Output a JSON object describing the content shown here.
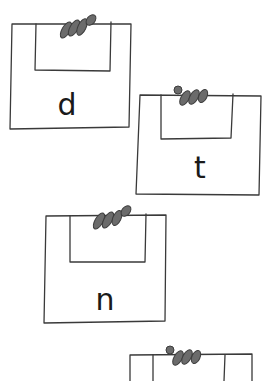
{
  "illustration": {
    "description": "Hand-drawn letter boxes with worm-like fingers peeking over the top edge",
    "stroke_color": "#3a3a3a",
    "worm_color": "#6b6b6b",
    "boxes": [
      {
        "letter": "d"
      },
      {
        "letter": "t"
      },
      {
        "letter": "n"
      },
      {
        "letter": ""
      }
    ]
  }
}
